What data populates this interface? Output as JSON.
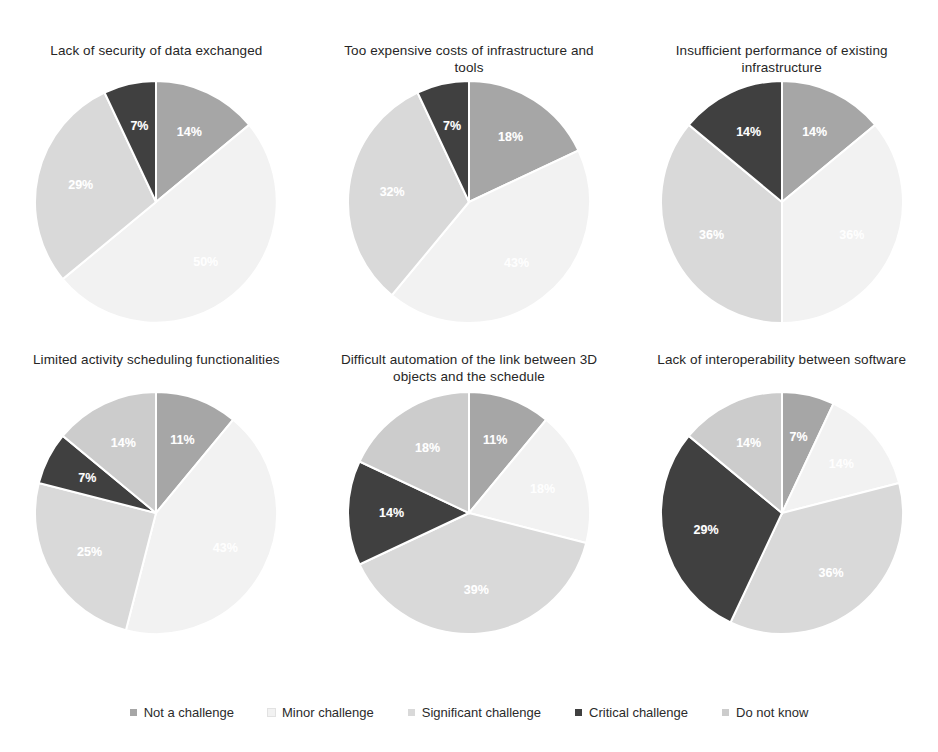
{
  "legend": {
    "position": "bottom",
    "items": [
      {
        "label": "Not a challenge",
        "color": "#a6a6a6"
      },
      {
        "label": "Minor challenge",
        "color": "#f2f2f2"
      },
      {
        "label": "Significant challenge",
        "color": "#d9d9d9"
      },
      {
        "label": "Critical challenge",
        "color": "#404040"
      },
      {
        "label": "Do not know",
        "color": "#cccccc"
      }
    ]
  },
  "chart_data": [
    {
      "type": "pie",
      "title": "Lack of security of data exchanged",
      "categories": [
        "Not a challenge",
        "Minor challenge",
        "Significant challenge",
        "Critical challenge",
        "Do not know"
      ],
      "values": [
        14,
        50,
        29,
        7,
        0
      ],
      "labels": [
        "14%",
        "50%",
        "29%",
        "7%",
        ""
      ],
      "colors": [
        "#a6a6a6",
        "#f2f2f2",
        "#d9d9d9",
        "#404040",
        "#cccccc"
      ],
      "units": "percent",
      "start_angle_deg": 0,
      "direction": "clockwise"
    },
    {
      "type": "pie",
      "title": "Too expensive costs of infrastructure and tools",
      "categories": [
        "Not a challenge",
        "Minor challenge",
        "Significant challenge",
        "Critical challenge",
        "Do not know"
      ],
      "values": [
        18,
        43,
        32,
        7,
        0
      ],
      "labels": [
        "18%",
        "43%",
        "32%",
        "7%",
        ""
      ],
      "colors": [
        "#a6a6a6",
        "#f2f2f2",
        "#d9d9d9",
        "#404040",
        "#cccccc"
      ],
      "units": "percent",
      "start_angle_deg": 0,
      "direction": "clockwise"
    },
    {
      "type": "pie",
      "title": "Insufficient performance of existing infrastructure",
      "categories": [
        "Not a challenge",
        "Minor challenge",
        "Significant challenge",
        "Critical challenge",
        "Do not know"
      ],
      "values": [
        14,
        36,
        36,
        14,
        0
      ],
      "labels": [
        "14%",
        "36%",
        "36%",
        "14%",
        ""
      ],
      "colors": [
        "#a6a6a6",
        "#f2f2f2",
        "#d9d9d9",
        "#404040",
        "#cccccc"
      ],
      "units": "percent",
      "start_angle_deg": 0,
      "direction": "clockwise"
    },
    {
      "type": "pie",
      "title": "Limited activity scheduling functionalities",
      "categories": [
        "Not a challenge",
        "Minor challenge",
        "Significant challenge",
        "Critical challenge",
        "Do not know"
      ],
      "values": [
        11,
        43,
        25,
        7,
        14
      ],
      "labels": [
        "11%",
        "43%",
        "25%",
        "7%",
        "14%"
      ],
      "colors": [
        "#a6a6a6",
        "#f2f2f2",
        "#d9d9d9",
        "#404040",
        "#cccccc"
      ],
      "units": "percent",
      "start_angle_deg": 0,
      "direction": "clockwise"
    },
    {
      "type": "pie",
      "title": "Difficult automation of the link between 3D objects and the schedule",
      "categories": [
        "Not a challenge",
        "Minor challenge",
        "Significant challenge",
        "Critical challenge",
        "Do not know"
      ],
      "values": [
        11,
        18,
        39,
        14,
        18
      ],
      "labels": [
        "11%",
        "18%",
        "39%",
        "14%",
        "18%"
      ],
      "colors": [
        "#a6a6a6",
        "#f2f2f2",
        "#d9d9d9",
        "#404040",
        "#cccccc"
      ],
      "units": "percent",
      "start_angle_deg": 0,
      "direction": "clockwise"
    },
    {
      "type": "pie",
      "title": "Lack of interoperability between software",
      "categories": [
        "Not a challenge",
        "Minor challenge",
        "Significant challenge",
        "Critical challenge",
        "Do not know"
      ],
      "values": [
        7,
        14,
        36,
        29,
        14
      ],
      "labels": [
        "7%",
        "14%",
        "36%",
        "29%",
        "14%"
      ],
      "colors": [
        "#a6a6a6",
        "#f2f2f2",
        "#d9d9d9",
        "#404040",
        "#cccccc"
      ],
      "units": "percent",
      "start_angle_deg": 0,
      "direction": "clockwise"
    }
  ]
}
